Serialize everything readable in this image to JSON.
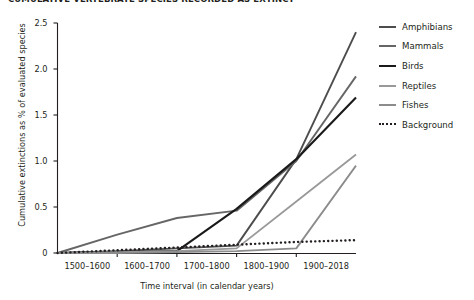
{
  "chart_data": {
    "type": "line",
    "title": "CUMULATIVE VERTEBRATE SPECIES RECORDED AS EXTINCT",
    "xlabel": "Time interval (in calendar years)",
    "ylabel": "Cumulative extinctions as % of evaluated species",
    "categories": [
      "1500–1600",
      "1600–1700",
      "1700–1800",
      "1800–1900",
      "1900–2018"
    ],
    "x_start_label": "",
    "ylim": [
      0,
      2.5
    ],
    "yticks": [
      "0",
      "0.5",
      "1.0",
      "1.5",
      "2.0",
      "2.5"
    ],
    "ytick_values": [
      0,
      0.5,
      1.0,
      1.5,
      2.0,
      2.5
    ],
    "grid": false,
    "legend_position": "right",
    "series": [
      {
        "name": "Amphibians",
        "color": "#4d4d4d",
        "style": "solid",
        "width": 1.9,
        "values": [
          0.02,
          0.05,
          0.08,
          1.02,
          2.4
        ]
      },
      {
        "name": "Mammals",
        "color": "#666666",
        "style": "solid",
        "width": 1.9,
        "values": [
          0.2,
          0.38,
          0.46,
          1.0,
          1.92
        ]
      },
      {
        "name": "Birds",
        "color": "#1a1a1a",
        "style": "solid",
        "width": 2.1,
        "values": [
          0.01,
          0.02,
          0.48,
          1.02,
          1.69
        ]
      },
      {
        "name": "Reptiles",
        "color": "#999999",
        "style": "solid",
        "width": 1.8,
        "values": [
          0.01,
          0.02,
          0.05,
          0.56,
          1.07
        ]
      },
      {
        "name": "Fishes",
        "color": "#8c8c8c",
        "style": "solid",
        "width": 1.8,
        "values": [
          0.0,
          0.01,
          0.02,
          0.05,
          0.95
        ]
      },
      {
        "name": "Background",
        "color": "#231f20",
        "style": "dotted",
        "width": 2.4,
        "values": [
          0.03,
          0.06,
          0.09,
          0.12,
          0.14
        ]
      }
    ],
    "origin_value": 0
  }
}
